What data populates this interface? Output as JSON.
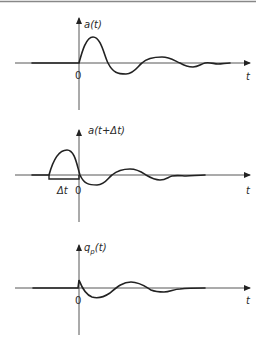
{
  "figure": {
    "panels": [
      {
        "id": "a",
        "y_label": "a(t)",
        "x_label": "t",
        "origin_label": "0",
        "description": "Damped oscillating response a(t) starting at t=0"
      },
      {
        "id": "a_shifted",
        "y_label": "a(t+Δt)",
        "x_label": "t",
        "origin_label": "0",
        "shift_label": "Δt",
        "description": "Same response shifted left by Δt"
      },
      {
        "id": "qp",
        "y_label_main": "q",
        "y_label_sub": "p",
        "y_label_tail": "(t)",
        "x_label": "t",
        "origin_label": "0",
        "description": "Difference signal qp(t), small spike at 0 then damped oscillation"
      }
    ]
  }
}
